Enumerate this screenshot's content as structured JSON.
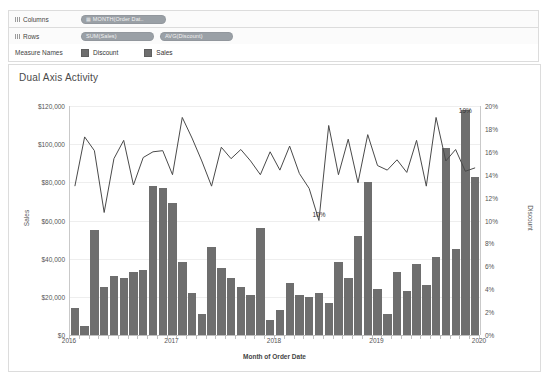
{
  "shelves": {
    "columns_label": "Columns",
    "rows_label": "Rows",
    "columns_pills": [
      {
        "text": "MONTH(Order Dat..",
        "icon": "calendar-icon"
      }
    ],
    "rows_pills": [
      {
        "text": "SUM(Sales)",
        "icon": "measure-icon"
      },
      {
        "text": "AVG(Discount)",
        "icon": "measure-icon"
      }
    ]
  },
  "legend": {
    "title": "Measure Names",
    "items": [
      {
        "label": "Discount",
        "color": "#6e6e6e"
      },
      {
        "label": "Sales",
        "color": "#6e6e6e"
      }
    ]
  },
  "viz": {
    "title": "Dual Axis Activity"
  },
  "chart_data": {
    "type": "bar",
    "title": "Dual Axis Activity",
    "xlabel": "Month of Order Date",
    "grid": true,
    "legend_position": "top",
    "x_tick_labels": [
      "2016",
      "2017",
      "2018",
      "2019",
      "2020"
    ],
    "axes": {
      "left": {
        "label": "Sales",
        "ticks": [
          "$0",
          "$20,000",
          "$40,000",
          "$60,000",
          "$80,000",
          "$100,000",
          "$120,000"
        ],
        "lim": [
          0,
          120000
        ]
      },
      "right": {
        "label": "Discount",
        "ticks": [
          "0%",
          "2%",
          "4%",
          "6%",
          "8%",
          "10%",
          "12%",
          "14%",
          "16%",
          "18%",
          "20%"
        ],
        "lim": [
          0,
          20
        ]
      }
    },
    "annotations": [
      {
        "text": "19%",
        "x_index": 40,
        "value": 19
      },
      {
        "text": "10%",
        "x_index": 25,
        "value": 10
      }
    ],
    "series": [
      {
        "name": "Sales",
        "type": "bar",
        "color": "#6e6e6e",
        "axis": "left",
        "values": [
          14000,
          4600,
          55000,
          25000,
          31000,
          30000,
          33000,
          34000,
          78000,
          77000,
          69000,
          38000,
          22000,
          11000,
          46000,
          35000,
          30000,
          25000,
          21000,
          56000,
          8000,
          13000,
          27000,
          21000,
          20000,
          22000,
          17000,
          38000,
          30000,
          52000,
          80000,
          24000,
          11000,
          33000,
          23000,
          37000,
          26000,
          41000,
          98000,
          45000,
          118000,
          83000
        ]
      },
      {
        "name": "Discount",
        "type": "line",
        "color": "#4a4a4a",
        "axis": "right",
        "values": [
          13.0,
          17.3,
          16.1,
          10.7,
          15.4,
          17.0,
          13.1,
          15.5,
          16.0,
          16.1,
          14.0,
          19.0,
          17.2,
          15.2,
          13.0,
          16.4,
          15.4,
          16.2,
          15.2,
          14.0,
          16.0,
          14.4,
          16.5,
          14.1,
          12.8,
          10.0,
          18.3,
          14.0,
          17.1,
          13.3,
          17.5,
          14.8,
          14.4,
          15.3,
          14.2,
          17.0,
          13.0,
          19.0,
          15.2,
          16.2,
          14.3,
          14.6
        ]
      }
    ]
  }
}
